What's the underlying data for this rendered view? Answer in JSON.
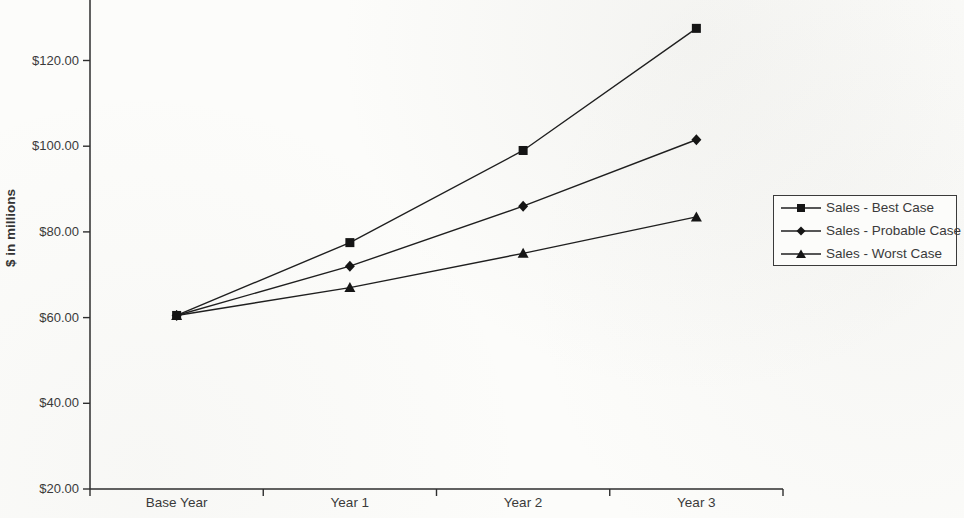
{
  "chart_data": {
    "type": "line",
    "title": "",
    "xlabel": "",
    "ylabel": "$ in millions",
    "categories": [
      "Base Year",
      "Year 1",
      "Year 2",
      "Year 3"
    ],
    "series": [
      {
        "name": "Sales - Worst Case",
        "marker": "triangle",
        "values": [
          60.5,
          67.0,
          75.0,
          83.5
        ]
      },
      {
        "name": "Sales - Probable Case",
        "marker": "diamond",
        "values": [
          60.5,
          72.0,
          86.0,
          101.5
        ]
      },
      {
        "name": "Sales - Best Case",
        "marker": "square",
        "values": [
          60.5,
          77.5,
          99.0,
          127.5
        ]
      }
    ],
    "legend_order": [
      "Sales - Best Case",
      "Sales - Probable Case",
      "Sales - Worst Case"
    ],
    "y_axis": {
      "min": 20,
      "max": 134,
      "tick_interval": 20,
      "tick_values": [
        20,
        40,
        60,
        80,
        100,
        120
      ],
      "tick_labels": [
        "$20.00",
        "$40.00",
        "$60.00",
        "$80.00",
        "$100.00",
        "$120.00"
      ]
    },
    "grid": false,
    "legend_position": "right"
  },
  "colors": {
    "line": "#1f1f1f",
    "marker": "#151515",
    "axis": "#2e2e2e",
    "text": "#3a3a3a",
    "background": "#fcfcfa",
    "legend_border": "#3a3a3a"
  }
}
